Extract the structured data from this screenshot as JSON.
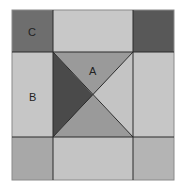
{
  "diagram": {
    "type": "quilt-block",
    "labels": {
      "a": "A",
      "b": "B",
      "c": "C"
    },
    "colors": {
      "background": "#ffffff",
      "outline": "#2a2a2a",
      "corner_top_left": "#6e6e6e",
      "corner_top_right": "#585858",
      "corner_bottom_left": "#a8a8a8",
      "corner_bottom_right": "#b4b4b4",
      "edge_light": "#c6c6c6",
      "center_top_triangle": "#9a9a9a",
      "center_left_triangle": "#4a4a4a",
      "center_right_triangle": "#c4c4c4",
      "center_bottom_triangle": "#9a9a9a"
    },
    "regions": [
      {
        "id": "corner-tl",
        "label": "C",
        "shape": "square"
      },
      {
        "id": "edge-top",
        "shape": "rectangle"
      },
      {
        "id": "corner-tr",
        "shape": "square"
      },
      {
        "id": "edge-left",
        "label": "B",
        "shape": "rectangle"
      },
      {
        "id": "center-top-triangle",
        "label": "A",
        "shape": "triangle"
      },
      {
        "id": "center-left-triangle",
        "shape": "triangle"
      },
      {
        "id": "center-right-triangle",
        "shape": "triangle"
      },
      {
        "id": "center-bottom-triangle",
        "shape": "triangle"
      },
      {
        "id": "edge-right",
        "shape": "rectangle"
      },
      {
        "id": "corner-bl",
        "shape": "square"
      },
      {
        "id": "edge-bottom",
        "shape": "rectangle"
      },
      {
        "id": "corner-br",
        "shape": "square"
      }
    ]
  }
}
